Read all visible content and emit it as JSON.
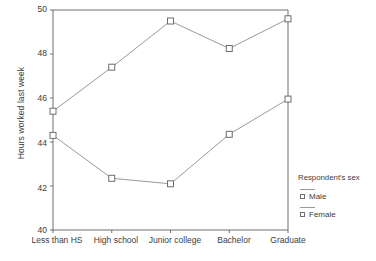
{
  "chart_data": {
    "type": "line",
    "title": "",
    "xlabel": "",
    "ylabel": "Hours worked last week",
    "categories": [
      "Less than HS",
      "High school",
      "Junior college",
      "Bachelor",
      "Graduate"
    ],
    "ylim": [
      40,
      50
    ],
    "yticks": [
      40,
      42,
      44,
      46,
      48,
      50
    ],
    "grid": false,
    "legend_position": "right",
    "legend_title": "Respondent's sex",
    "series": [
      {
        "name": "Male",
        "values": [
          45.4,
          47.4,
          49.5,
          48.25,
          49.6
        ]
      },
      {
        "name": "Female",
        "values": [
          44.3,
          42.35,
          42.1,
          44.35,
          45.95
        ]
      }
    ]
  },
  "axis": {
    "y_title": "Hours worked last week",
    "y_tick_labels": [
      "50",
      "48",
      "46",
      "44",
      "42",
      "40"
    ],
    "x_tick_labels": [
      "Less than HS",
      "High school",
      "Junior college",
      "Bachelor",
      "Graduate"
    ]
  },
  "legend": {
    "title": "Respondent's sex",
    "items": [
      {
        "label": "Male"
      },
      {
        "label": "Female"
      }
    ]
  },
  "colors": {
    "line": "#9a9a9a",
    "marker_stroke": "#6e6e6e",
    "axis": "#6e6e6e",
    "text": "#3d3d3d"
  }
}
